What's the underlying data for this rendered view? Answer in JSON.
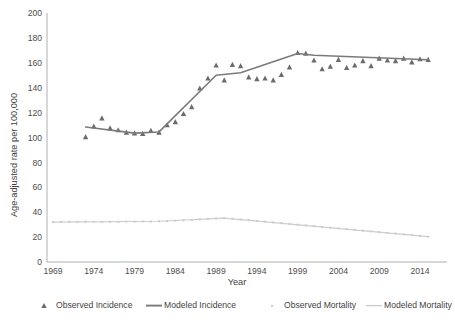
{
  "chart_data": {
    "type": "line",
    "title": "",
    "xlabel": "Year",
    "ylabel": "Age-adjusted rate per 100,000",
    "xlim": [
      1969,
      2016
    ],
    "ylim": [
      0,
      200
    ],
    "grid": false,
    "legend_position": "bottom",
    "xticks": [
      "1969",
      "1974",
      "1979",
      "1984",
      "1989",
      "1994",
      "1999",
      "2004",
      "2009",
      "2014"
    ],
    "xtick_values": [
      1969,
      1974,
      1979,
      1984,
      1989,
      1994,
      1999,
      2004,
      2009,
      2014
    ],
    "yticks": [
      "0",
      "20",
      "40",
      "60",
      "80",
      "100",
      "120",
      "140",
      "160",
      "180",
      "200"
    ],
    "ytick_values": [
      0,
      20,
      40,
      60,
      80,
      100,
      120,
      140,
      160,
      180,
      200
    ],
    "series": [
      {
        "name": "Observed Incidence",
        "type": "scatter",
        "marker": "triangle",
        "color": "#6b6b6b",
        "x": [
          1973,
          1974,
          1975,
          1976,
          1977,
          1978,
          1979,
          1980,
          1981,
          1982,
          1983,
          1984,
          1985,
          1986,
          1987,
          1988,
          1989,
          1990,
          1991,
          1992,
          1993,
          1994,
          1995,
          1996,
          1997,
          1998,
          1999,
          2000,
          2001,
          2002,
          2003,
          2004,
          2005,
          2006,
          2007,
          2008,
          2009,
          2010,
          2011,
          2012,
          2013,
          2014,
          2015
        ],
        "values": [
          100.5,
          109.0,
          115.5,
          107.5,
          106.0,
          104.0,
          103.5,
          103.0,
          105.5,
          104.0,
          110.0,
          112.5,
          119.0,
          124.5,
          139.5,
          147.5,
          158.0,
          146.0,
          158.5,
          157.5,
          148.5,
          147.0,
          147.5,
          146.0,
          150.5,
          156.5,
          168.0,
          167.5,
          162.0,
          155.0,
          157.0,
          162.5,
          156.0,
          158.0,
          161.5,
          157.5,
          163.5,
          162.0,
          161.5,
          163.5,
          160.5,
          163.0,
          162.5
        ]
      },
      {
        "name": "Modeled Incidence",
        "type": "line",
        "color": "#7a7a7a",
        "x": [
          1973,
          1979,
          1982,
          1989,
          1992,
          1999,
          2001,
          2015
        ],
        "values": [
          108.5,
          103.5,
          104.5,
          150.0,
          152.0,
          167.5,
          166.0,
          162.5
        ]
      },
      {
        "name": "Observed Mortality",
        "type": "scatter",
        "marker": "dot",
        "color": "#c8c8c8",
        "x": [
          1969,
          1970,
          1971,
          1972,
          1973,
          1974,
          1975,
          1976,
          1977,
          1978,
          1979,
          1980,
          1981,
          1982,
          1983,
          1984,
          1985,
          1986,
          1987,
          1988,
          1989,
          1990,
          1991,
          1992,
          1993,
          1994,
          1995,
          1996,
          1997,
          1998,
          1999,
          2000,
          2001,
          2002,
          2003,
          2004,
          2005,
          2006,
          2007,
          2008,
          2009,
          2010,
          2011,
          2012,
          2013,
          2014,
          2015
        ],
        "values": [
          32.0,
          32.2,
          32.3,
          32.2,
          32.4,
          32.3,
          32.2,
          32.4,
          32.3,
          32.5,
          32.4,
          32.6,
          32.5,
          32.7,
          32.8,
          33.2,
          33.5,
          33.8,
          34.2,
          34.6,
          35.0,
          35.2,
          34.8,
          34.2,
          33.6,
          33.0,
          32.4,
          31.8,
          31.2,
          30.6,
          30.0,
          29.4,
          28.8,
          28.2,
          27.6,
          27.0,
          26.4,
          25.8,
          25.2,
          24.6,
          24.0,
          23.4,
          22.8,
          22.2,
          21.6,
          21.0,
          20.4
        ]
      },
      {
        "name": "Modeled Mortality",
        "type": "line",
        "color": "#cdcdcd",
        "x": [
          1969,
          1982,
          1990,
          2015
        ],
        "values": [
          32.0,
          32.7,
          35.2,
          20.4
        ]
      }
    ]
  },
  "legend": {
    "items": [
      {
        "label": "Observed Incidence",
        "marker": "triangle",
        "color": "#6b6b6b"
      },
      {
        "label": "Modeled Incidence",
        "marker": "line",
        "color": "#7a7a7a"
      },
      {
        "label": "Observed Mortality",
        "marker": "dot",
        "color": "#cfcfcf"
      },
      {
        "label": "Modeled Mortality",
        "marker": "line",
        "color": "#cdcdcd"
      }
    ]
  },
  "axes": {
    "x_title": "Year",
    "y_title": "Age-adjusted rate per 100,000"
  }
}
